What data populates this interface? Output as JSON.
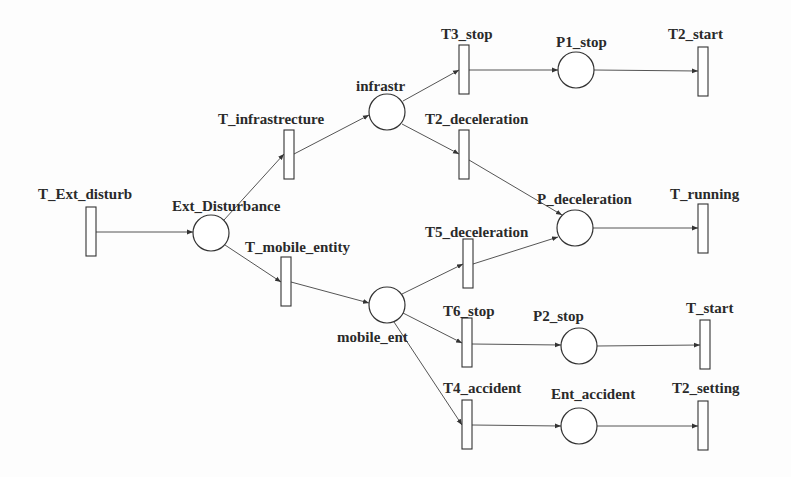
{
  "diagram": {
    "type": "petri-net",
    "places": [
      {
        "id": "ext_disturbance",
        "label": "Ext_Disturbance",
        "cx": 211,
        "cy": 233,
        "lx": 172,
        "ly": 211
      },
      {
        "id": "infrastr",
        "label": "infrastr",
        "cx": 387,
        "cy": 112,
        "lx": 356,
        "ly": 91
      },
      {
        "id": "p1_stop",
        "label": "P1_stop",
        "cx": 576,
        "cy": 70,
        "lx": 556,
        "ly": 47
      },
      {
        "id": "p_deceleration",
        "label": "P_deceleration",
        "cx": 575,
        "cy": 228,
        "lx": 537,
        "ly": 204
      },
      {
        "id": "mobile_ent",
        "label": "mobile_ent",
        "cx": 387,
        "cy": 305,
        "lx": 337,
        "ly": 342
      },
      {
        "id": "p2_stop",
        "label": "P2_stop",
        "cx": 579,
        "cy": 346,
        "lx": 533,
        "ly": 321
      },
      {
        "id": "ent_accident",
        "label": "Ent_accident",
        "cx": 579,
        "cy": 426,
        "lx": 551,
        "ly": 399
      }
    ],
    "transitions": [
      {
        "id": "t_ext_disturb",
        "label": "T_Ext_disturb",
        "x": 86,
        "y": 207,
        "lx": 38,
        "ly": 199
      },
      {
        "id": "t_infrastrecture",
        "label": "T_infrastrecture",
        "x": 284,
        "y": 130,
        "lx": 218,
        "ly": 124
      },
      {
        "id": "t3_stop",
        "label": "T3_stop",
        "x": 459,
        "y": 45,
        "lx": 441,
        "ly": 39
      },
      {
        "id": "t2_deceleration",
        "label": "T2_deceleration",
        "x": 459,
        "y": 130,
        "lx": 425,
        "ly": 124
      },
      {
        "id": "t2_start",
        "label": "T2_start",
        "x": 698,
        "y": 47,
        "lx": 668,
        "ly": 39
      },
      {
        "id": "t_mobile_entity",
        "label": "T_mobile_entity",
        "x": 281,
        "y": 257,
        "lx": 245,
        "ly": 252
      },
      {
        "id": "t5_deceleration",
        "label": "T5_deceleration",
        "x": 463,
        "y": 239,
        "lx": 425,
        "ly": 237
      },
      {
        "id": "t_running",
        "label": "T_running",
        "x": 698,
        "y": 204,
        "lx": 670,
        "ly": 199
      },
      {
        "id": "t6_stop",
        "label": "T6_stop",
        "x": 462,
        "y": 318,
        "lx": 443,
        "ly": 316
      },
      {
        "id": "t_start",
        "label": "T_start",
        "x": 700,
        "y": 320,
        "lx": 686,
        "ly": 313
      },
      {
        "id": "t4_accident",
        "label": "T4_accident",
        "x": 462,
        "y": 400,
        "lx": 443,
        "ly": 393
      },
      {
        "id": "t2_setting",
        "label": "T2_setting",
        "x": 698,
        "y": 401,
        "lx": 672,
        "ly": 393
      }
    ],
    "arcs": [
      {
        "from": "t_ext_disturb",
        "to": "ext_disturbance",
        "x1": 96,
        "y1": 232,
        "x2": 193,
        "y2": 232
      },
      {
        "from": "ext_disturbance",
        "to": "t_infrastrecture",
        "x1": 224,
        "y1": 220,
        "x2": 284,
        "y2": 154
      },
      {
        "from": "t_infrastrecture",
        "to": "infrastr",
        "x1": 294,
        "y1": 154,
        "x2": 369,
        "y2": 115
      },
      {
        "from": "infrastr",
        "to": "t3_stop",
        "x1": 403,
        "y1": 101,
        "x2": 459,
        "y2": 70
      },
      {
        "from": "infrastr",
        "to": "t2_deceleration",
        "x1": 402,
        "y1": 124,
        "x2": 459,
        "y2": 154
      },
      {
        "from": "t3_stop",
        "to": "p1_stop",
        "x1": 469,
        "y1": 70,
        "x2": 558,
        "y2": 70
      },
      {
        "from": "p1_stop",
        "to": "t2_start",
        "x1": 594,
        "y1": 70,
        "x2": 698,
        "y2": 71
      },
      {
        "from": "t2_deceleration",
        "to": "p_deceleration",
        "x1": 469,
        "y1": 160,
        "x2": 562,
        "y2": 215
      },
      {
        "from": "ext_disturbance",
        "to": "t_mobile_entity",
        "x1": 225,
        "y1": 245,
        "x2": 281,
        "y2": 282
      },
      {
        "from": "t_mobile_entity",
        "to": "mobile_ent",
        "x1": 291,
        "y1": 282,
        "x2": 369,
        "y2": 303
      },
      {
        "from": "mobile_ent",
        "to": "t5_deceleration",
        "x1": 402,
        "y1": 294,
        "x2": 463,
        "y2": 264
      },
      {
        "from": "t5_deceleration",
        "to": "p_deceleration",
        "x1": 473,
        "y1": 264,
        "x2": 558,
        "y2": 237
      },
      {
        "from": "p_deceleration",
        "to": "t_running",
        "x1": 593,
        "y1": 228,
        "x2": 698,
        "y2": 228
      },
      {
        "from": "mobile_ent",
        "to": "t6_stop",
        "x1": 403,
        "y1": 313,
        "x2": 462,
        "y2": 343
      },
      {
        "from": "t6_stop",
        "to": "p2_stop",
        "x1": 472,
        "y1": 344,
        "x2": 561,
        "y2": 345
      },
      {
        "from": "p2_stop",
        "to": "t_start",
        "x1": 597,
        "y1": 346,
        "x2": 700,
        "y2": 345
      },
      {
        "from": "mobile_ent",
        "to": "t4_accident",
        "x1": 394,
        "y1": 322,
        "x2": 462,
        "y2": 425
      },
      {
        "from": "t4_accident",
        "to": "ent_accident",
        "x1": 472,
        "y1": 425,
        "x2": 561,
        "y2": 426
      },
      {
        "from": "ent_accident",
        "to": "t2_setting",
        "x1": 597,
        "y1": 426,
        "x2": 698,
        "y2": 426
      }
    ]
  }
}
